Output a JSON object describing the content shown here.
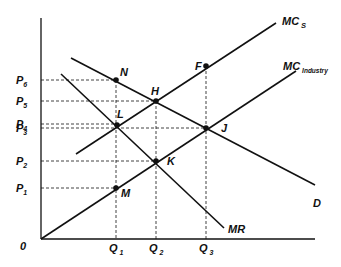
{
  "diagram": {
    "type": "economics-monopsony-marginal-cost",
    "origin_label": "0",
    "axes": {
      "origin": [
        41,
        239
      ],
      "y_top": 18,
      "x_right": 315
    },
    "price_labels": [
      {
        "id": "P6",
        "main": "P",
        "sub": "6",
        "y": 80
      },
      {
        "id": "P5",
        "main": "P",
        "sub": "5",
        "y": 101
      },
      {
        "id": "P4",
        "main": "P",
        "sub": "4",
        "y": 124
      },
      {
        "id": "P3",
        "main": "P",
        "sub": "3",
        "y": 128
      },
      {
        "id": "P2",
        "main": "P",
        "sub": "2",
        "y": 161
      },
      {
        "id": "P1",
        "main": "P",
        "sub": "1",
        "y": 188
      }
    ],
    "quantity_labels": [
      {
        "id": "Q1",
        "main": "Q",
        "sub": "1",
        "x": 116
      },
      {
        "id": "Q2",
        "main": "Q",
        "sub": "2",
        "x": 156
      },
      {
        "id": "Q3",
        "main": "Q",
        "sub": "3",
        "x": 206
      }
    ],
    "curves": [
      {
        "id": "MCs",
        "label_main": "MC",
        "label_sub": "S",
        "from": [
          76,
          154
        ],
        "to": [
          276,
          23
        ]
      },
      {
        "id": "MCindustry",
        "label_main": "MC",
        "label_sub": "Industry",
        "from": [
          41,
          239
        ],
        "to": [
          296,
          71
        ]
      },
      {
        "id": "D",
        "label_main": "D",
        "label_sub": "",
        "from": [
          71,
          58
        ],
        "to": [
          315,
          185
        ]
      },
      {
        "id": "MR",
        "label_main": "MR",
        "label_sub": "",
        "from": [
          61,
          74
        ],
        "to": [
          224,
          228
        ]
      }
    ],
    "points": [
      {
        "id": "N",
        "label": "N",
        "x": 116,
        "y": 80,
        "lx": 120,
        "ly": 76
      },
      {
        "id": "H",
        "label": "H",
        "x": 156,
        "y": 101,
        "lx": 151,
        "ly": 95
      },
      {
        "id": "L",
        "label": "L",
        "x": 117,
        "y": 125,
        "lx": 117,
        "ly": 118
      },
      {
        "id": "J",
        "label": "J",
        "x": 206,
        "y": 128,
        "lx": 221,
        "ly": 132
      },
      {
        "id": "K",
        "label": "K",
        "x": 156,
        "y": 161,
        "lx": 167,
        "ly": 165
      },
      {
        "id": "M",
        "label": "M",
        "x": 116,
        "y": 188,
        "lx": 121,
        "ly": 197
      },
      {
        "id": "F",
        "label": "F",
        "x": 206,
        "y": 66,
        "lx": 195,
        "ly": 70
      }
    ],
    "colors": {
      "line": "#111111",
      "background": "#ffffff"
    }
  }
}
